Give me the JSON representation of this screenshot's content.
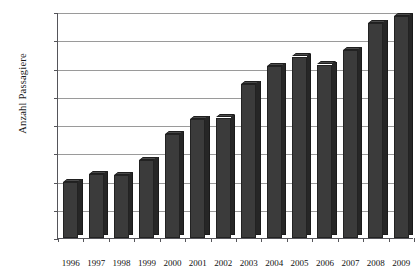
{
  "chart_data": {
    "type": "bar",
    "title": "",
    "xlabel": "",
    "ylabel": "Anzahl Passagiere",
    "categories": [
      "1996",
      "1997",
      "1998",
      "1999",
      "2000",
      "2001",
      "2002",
      "2003",
      "2004",
      "2005",
      "2006",
      "2007",
      "2008",
      "2009"
    ],
    "values": [
      99000,
      113000,
      111000,
      138000,
      184000,
      211000,
      213000,
      272000,
      304000,
      321000,
      307000,
      333000,
      380000,
      393000
    ],
    "series": [
      {
        "name": "Anzahl Passagiere",
        "values": [
          99000,
          113000,
          111000,
          138000,
          184000,
          211000,
          213000,
          272000,
          304000,
          321000,
          307000,
          333000,
          380000,
          393000
        ]
      }
    ],
    "ylim": [
      0,
      400000
    ],
    "ytick_values": [
      0,
      50000,
      100000,
      150000,
      200000,
      250000,
      300000,
      350000,
      400000
    ],
    "ytick_labels": [
      "0",
      "50000",
      "100000",
      "150000",
      "200000",
      "250000",
      "300000",
      "350000",
      "400000"
    ],
    "grid": true,
    "grid_axis": "y",
    "legend": false,
    "legend_position": "none",
    "bar_color": "#3b3b3b",
    "bar_side_color": "#262626",
    "gridline_color": "#9a9a9a",
    "axis_color": "#55555a",
    "background_color": "#ffffff",
    "style": "3d-bar"
  }
}
